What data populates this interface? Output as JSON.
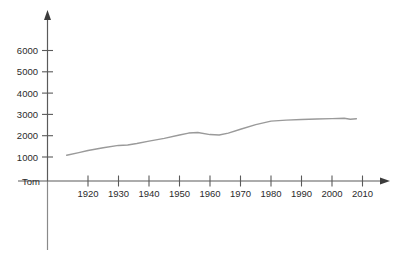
{
  "chart_data": {
    "type": "line",
    "title": "",
    "subtitle": "",
    "xlabel": "",
    "ylabel": "",
    "origin_label": "Tom",
    "grid": false,
    "legend": false,
    "xlim": [
      1910,
      2016
    ],
    "ylim": [
      0,
      6800
    ],
    "x_ticks": [
      1920,
      1930,
      1940,
      1950,
      1960,
      1970,
      1980,
      1990,
      2000,
      2010
    ],
    "x_tick_labels": [
      "1920",
      "1930",
      "1940",
      "1950",
      "1960",
      "1970",
      "1980",
      "1990",
      "2000",
      "2010"
    ],
    "y_ticks": [
      1000,
      2000,
      3000,
      4000,
      5000,
      6000
    ],
    "y_tick_labels": [
      "1000",
      "2000",
      "3000",
      "4000",
      "5000",
      "6000"
    ],
    "series": [
      {
        "name": "",
        "color": "#9a9a9a",
        "x": [
          1913,
          1917,
          1920,
          1925,
          1930,
          1933,
          1936,
          1940,
          1945,
          1950,
          1953,
          1956,
          1960,
          1963,
          1966,
          1970,
          1975,
          1980,
          1985,
          1990,
          1995,
          2000,
          2004,
          2006,
          2008
        ],
        "values": [
          1210,
          1330,
          1430,
          1560,
          1670,
          1690,
          1760,
          1870,
          2000,
          2160,
          2250,
          2280,
          2180,
          2160,
          2250,
          2430,
          2650,
          2810,
          2860,
          2890,
          2910,
          2930,
          2945,
          2900,
          2920
        ]
      }
    ]
  },
  "axes": {
    "x_axis_name": "x-axis",
    "y_axis_name": "y-axis"
  }
}
